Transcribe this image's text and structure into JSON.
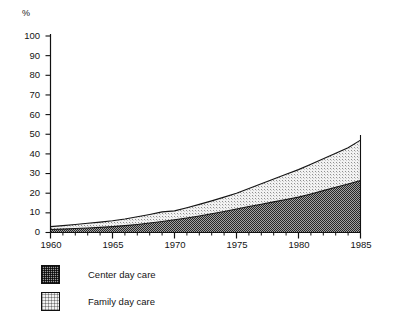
{
  "chart_data": {
    "type": "area",
    "stacked": true,
    "title": "",
    "subtitle": "",
    "xlabel": "",
    "ylabel": "%",
    "unit_label": "%",
    "x": [
      1960,
      1961,
      1962,
      1963,
      1964,
      1965,
      1966,
      1967,
      1968,
      1969,
      1970,
      1971,
      1972,
      1973,
      1974,
      1975,
      1976,
      1977,
      1978,
      1979,
      1980,
      1981,
      1982,
      1983,
      1984,
      1985
    ],
    "xlim": [
      1960,
      1985
    ],
    "ylim": [
      0,
      100
    ],
    "grid": false,
    "legend_position": "below-left",
    "x_tick_labels": [
      "1960",
      "1965",
      "1970",
      "1975",
      "1980",
      "1985"
    ],
    "x_tick_values": [
      1960,
      1965,
      1970,
      1975,
      1980,
      1985
    ],
    "x_minor_tick_interval": 1,
    "y_tick_labels": [
      "0",
      "10",
      "20",
      "30",
      "40",
      "50",
      "60",
      "70",
      "80",
      "90",
      "100"
    ],
    "y_tick_values": [
      0,
      10,
      20,
      30,
      40,
      50,
      60,
      70,
      80,
      90,
      100
    ],
    "series": [
      {
        "name": "Center day care",
        "fill": "dark-crosshatch",
        "color": "#9a9a9a",
        "values": [
          1.5,
          1.7,
          2.0,
          2.3,
          2.6,
          3.0,
          3.5,
          4.1,
          4.8,
          5.6,
          6.5,
          7.4,
          8.4,
          9.5,
          10.7,
          12.0,
          13.2,
          14.4,
          15.6,
          16.8,
          18.0,
          19.6,
          21.3,
          23.0,
          24.7,
          26.5
        ]
      },
      {
        "name": "Family day care",
        "fill": "light-stipple",
        "color": "#f1f1f1",
        "values": [
          1.5,
          1.8,
          2.1,
          2.4,
          2.7,
          3.0,
          3.4,
          3.9,
          4.4,
          4.9,
          4.5,
          5.2,
          5.9,
          6.6,
          7.3,
          8.0,
          9.2,
          10.4,
          11.6,
          12.8,
          14.0,
          15.1,
          16.2,
          17.3,
          18.4,
          20.5
        ]
      }
    ],
    "totals": [
      3.0,
      3.5,
      4.1,
      4.7,
      5.3,
      6.0,
      6.9,
      8.0,
      9.2,
      10.5,
      11.0,
      12.6,
      14.3,
      16.1,
      18.0,
      20.0,
      22.4,
      24.8,
      27.2,
      29.6,
      32.0,
      34.7,
      37.5,
      40.3,
      43.1,
      47.0
    ]
  },
  "axis": {
    "unit_label": "%",
    "y_ticks": [
      "100",
      "90",
      "80",
      "70",
      "60",
      "50",
      "40",
      "30",
      "20",
      "10",
      "0"
    ],
    "x_ticks": [
      "1960",
      "1965",
      "1970",
      "1975",
      "1980",
      "1985"
    ]
  },
  "legend": {
    "items": [
      {
        "label": "Center day care",
        "swatch": "dark-crosshatch-swatch"
      },
      {
        "label": "Family day care",
        "swatch": "light-stipple-swatch"
      }
    ]
  },
  "colors": {
    "axis": "#111111",
    "center_fill": "#9a9a9a",
    "family_fill": "#f1f1f1",
    "background": "#ffffff"
  }
}
